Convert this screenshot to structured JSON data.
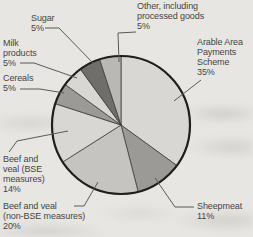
{
  "chart_data": {
    "type": "pie",
    "title": "",
    "unit": "%",
    "legend_position": "outside-callout-labels",
    "background_color": "#e7e6e2",
    "outline_color": "#201f1c",
    "slice_border_color": "#33322e",
    "leader_color": "#5b5a55",
    "text_color": "#464543",
    "slices": [
      {
        "id": "arable",
        "name": "Arable Area Payments Scheme",
        "value": 35,
        "color": "#d8d7d3",
        "label": "Arable Area\nPayments\nScheme\n35%"
      },
      {
        "id": "sheepmeat",
        "name": "Sheepmeat",
        "value": 11,
        "color": "#9b9a96",
        "label": "Sheepmeat\n11%"
      },
      {
        "id": "nonbse",
        "name": "Beef and veal (non-BSE measures)",
        "value": 20,
        "color": "#c5c4c0",
        "label": "Beef and veal\n(non-BSE measures)\n20%"
      },
      {
        "id": "bse",
        "name": "Beef and veal (BSE measures)",
        "value": 14,
        "color": "#d8d7d3",
        "label": "Beef and\nveal (BSE\nmeasures)\n14%"
      },
      {
        "id": "cereals",
        "name": "Cereals",
        "value": 5,
        "color": "#9b9a96",
        "label": "Cereals\n5%"
      },
      {
        "id": "milk",
        "name": "Milk products",
        "value": 5,
        "color": "#d8d7d3",
        "label": "Milk\nproducts\n5%"
      },
      {
        "id": "sugar",
        "name": "Sugar",
        "value": 5,
        "color": "#6f6e6b",
        "label": "Sugar\n5%"
      },
      {
        "id": "other",
        "name": "Other, including processed goods",
        "value": 5,
        "color": "#b9b8b4",
        "label": "Other, including\nprocessed goods\n5%"
      }
    ],
    "geometry_note": "slices drawn clockwise starting at 12 o'clock"
  }
}
